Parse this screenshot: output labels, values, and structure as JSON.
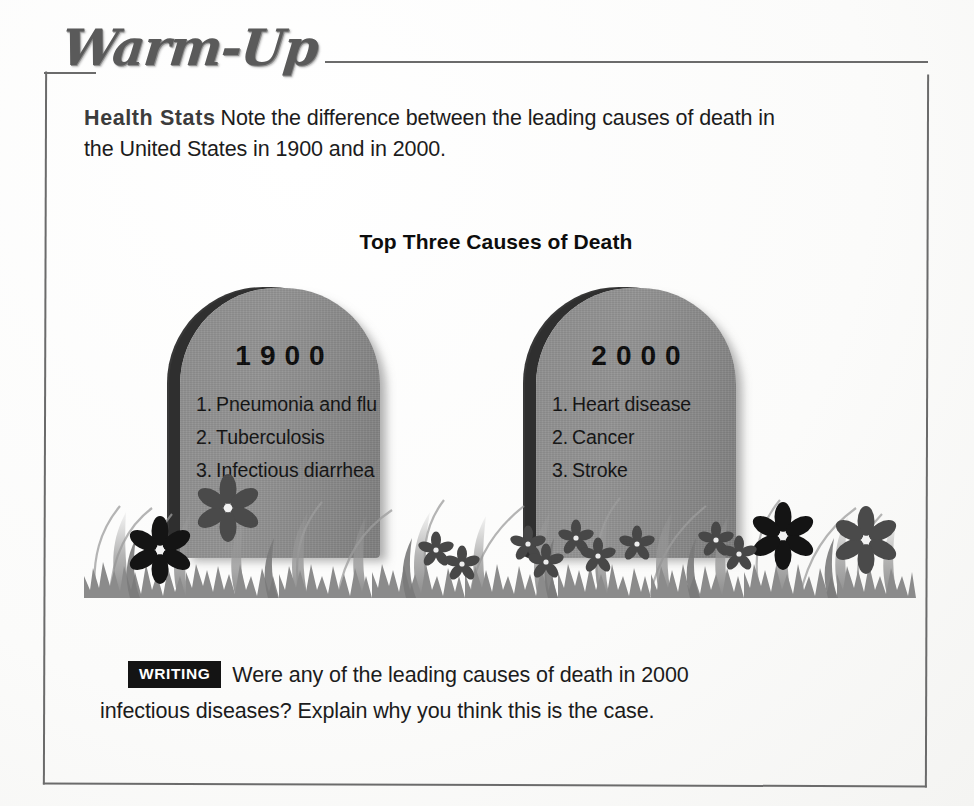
{
  "header": {
    "section_title": "Warm-Up"
  },
  "intro": {
    "label": "Health Stats",
    "text": "Note the difference between the leading causes of death in the United States in 1900 and in 2000."
  },
  "graphic": {
    "title": "Top Three Causes of Death",
    "stones": [
      {
        "year": "1900",
        "causes": [
          {
            "num": "1.",
            "label": "Pneumonia and flu"
          },
          {
            "num": "2.",
            "label": "Tuberculosis"
          },
          {
            "num": "3.",
            "label": "Infectious diarrhea"
          }
        ]
      },
      {
        "year": "2000",
        "causes": [
          {
            "num": "1.",
            "label": "Heart disease"
          },
          {
            "num": "2.",
            "label": "Cancer"
          },
          {
            "num": "3.",
            "label": "Stroke"
          }
        ]
      }
    ],
    "scene_icon": "tombstone-icon",
    "grass_icon": "grass-and-flowers-icon"
  },
  "writing": {
    "badge": "WRITING",
    "line1": "Were any of the leading causes of death in 2000",
    "line2": "infectious diseases? Explain why you think this is the case."
  },
  "colors": {
    "frame": "#6b6b6b",
    "stone_face": "#8f8f8f",
    "stone_edge": "#343434",
    "grass": "#8b8b8b",
    "flower_dark": "#1a1a1a",
    "badge_bg": "#141414",
    "text": "#1c1c1c"
  }
}
